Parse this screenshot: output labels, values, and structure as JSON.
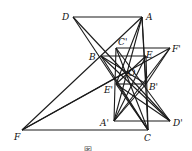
{
  "diagram": {
    "stroke_color": "#1a1a1a",
    "points": {
      "D": {
        "label": "D",
        "x": 73,
        "y": 17,
        "lx": 62,
        "ly": 20
      },
      "A": {
        "label": "A",
        "x": 142,
        "y": 17,
        "lx": 146,
        "ly": 20
      },
      "C1": {
        "label": "C'",
        "x": 116,
        "y": 48,
        "lx": 118,
        "ly": 45
      },
      "F1": {
        "label": "F'",
        "x": 170,
        "y": 48,
        "lx": 172,
        "ly": 52
      },
      "B": {
        "label": "B",
        "x": 101,
        "y": 56,
        "lx": 89,
        "ly": 60
      },
      "E": {
        "label": "E",
        "x": 146,
        "y": 56,
        "lx": 146,
        "ly": 58
      },
      "O": {
        "label": "O",
        "x": 126,
        "y": 72,
        "lx": 128,
        "ly": 76
      },
      "E1": {
        "label": "E'",
        "x": 116,
        "y": 84,
        "lx": 104,
        "ly": 93
      },
      "B1": {
        "label": "B'",
        "x": 146,
        "y": 84,
        "lx": 149,
        "ly": 90
      },
      "A1": {
        "label": "A'",
        "x": 114,
        "y": 121,
        "lx": 100,
        "ly": 126
      },
      "D1": {
        "label": "D'",
        "x": 170,
        "y": 121,
        "lx": 173,
        "ly": 126
      },
      "F": {
        "label": "F",
        "x": 22,
        "y": 130,
        "lx": 14,
        "ly": 140
      },
      "C": {
        "label": "C",
        "x": 148,
        "y": 130,
        "lx": 144,
        "ly": 141
      }
    },
    "segments": [
      [
        "D",
        "A"
      ],
      [
        "F",
        "C"
      ],
      [
        "A",
        "C"
      ],
      [
        "A",
        "F"
      ],
      [
        "D",
        "C"
      ],
      [
        "D",
        "D1"
      ],
      [
        "F",
        "F1"
      ],
      [
        "F",
        "O"
      ],
      [
        "B",
        "B1"
      ],
      [
        "C1",
        "F1"
      ],
      [
        "F1",
        "A1"
      ],
      [
        "C1",
        "A1"
      ],
      [
        "F1",
        "B1"
      ],
      [
        "B",
        "E"
      ],
      [
        "E1",
        "B1"
      ],
      [
        "A1",
        "D1"
      ],
      [
        "E",
        "C"
      ],
      [
        "C1",
        "C"
      ],
      [
        "A",
        "A1"
      ],
      [
        "A",
        "E1"
      ],
      [
        "B",
        "D1"
      ],
      [
        "E",
        "A1"
      ],
      [
        "E1",
        "C"
      ],
      [
        "C1",
        "D1"
      ],
      [
        "E",
        "E1"
      ],
      [
        "B1",
        "A1"
      ],
      [
        "E1",
        "D1"
      ],
      [
        "A",
        "B1"
      ],
      [
        "B",
        "C"
      ]
    ],
    "caption": "图"
  }
}
